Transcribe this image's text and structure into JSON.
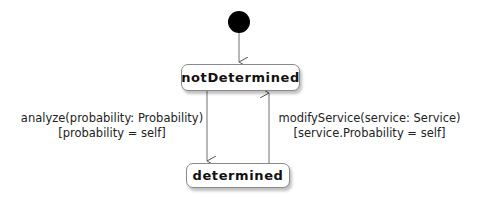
{
  "diagram": {
    "type": "state-machine",
    "initial": {
      "name": "initial-state"
    },
    "states": [
      {
        "id": "notDetermined",
        "label": "notDetermined"
      },
      {
        "id": "determined",
        "label": "determined"
      }
    ],
    "transitions": [
      {
        "from": "initial",
        "to": "notDetermined",
        "trigger": "",
        "guard": ""
      },
      {
        "from": "notDetermined",
        "to": "determined",
        "trigger": "analyze(probability: Probability)",
        "guard": "[probability = self]"
      },
      {
        "from": "determined",
        "to": "notDetermined",
        "trigger": "modifyService(service: Service)",
        "guard": "[service.Probability = self]"
      }
    ],
    "colors": {
      "line": "#707070",
      "initial_fill": "#000000",
      "state_border": "#8a8a8a"
    }
  }
}
